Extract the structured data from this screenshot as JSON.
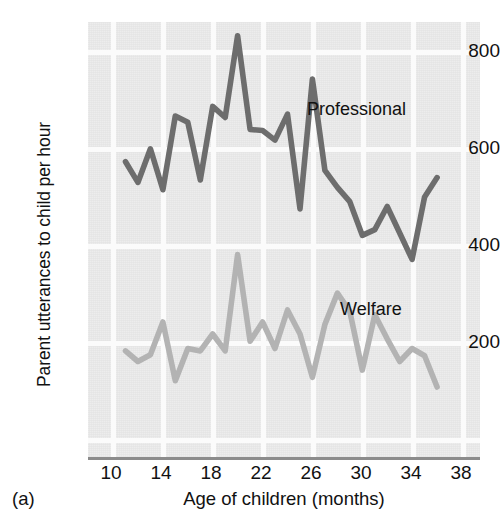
{
  "figure": {
    "panel_letter": "(a)",
    "background": "#e9e9e9",
    "gridline_color": "#fbfbfb",
    "axis_color": "#8b8b8b"
  },
  "labels": {
    "ylabel": "Parent utterances to child per hour",
    "xlabel": "Age of children (months)",
    "professional": "Professional",
    "welfare": "Welfare"
  },
  "axes": {
    "yticks": [
      "800",
      "600",
      "400",
      "200"
    ],
    "xticks": [
      "10",
      "14",
      "18",
      "22",
      "26",
      "30",
      "34",
      "38"
    ]
  },
  "chart_data": {
    "type": "line",
    "title": "",
    "xlabel": "Age of children (months)",
    "ylabel": "Parent utterances to child per hour",
    "xlim": [
      9,
      38
    ],
    "ylim": [
      0,
      870
    ],
    "yticks": [
      200,
      400,
      600,
      800
    ],
    "xticks": [
      10,
      14,
      18,
      22,
      26,
      30,
      34,
      38
    ],
    "grid": true,
    "legend": "inline-annotation",
    "series": [
      {
        "name": "Professional",
        "color": "#6d6d6d",
        "x": [
          11,
          12,
          13,
          14,
          15,
          16,
          17,
          18,
          19,
          20,
          21,
          22,
          23,
          24,
          25,
          26,
          27,
          28,
          29,
          30,
          31,
          32,
          33,
          34,
          35,
          36
        ],
        "values": [
          573,
          530,
          600,
          515,
          668,
          655,
          535,
          688,
          665,
          835,
          640,
          638,
          618,
          672,
          475,
          745,
          555,
          520,
          490,
          420,
          432,
          480,
          425,
          370,
          500,
          540
        ]
      },
      {
        "name": "Welfare",
        "color": "#b3b3b3",
        "x": [
          11,
          12,
          13,
          14,
          15,
          16,
          17,
          18,
          19,
          20,
          21,
          22,
          23,
          24,
          25,
          26,
          27,
          28,
          29,
          30,
          31,
          32,
          33,
          34,
          35,
          36
        ],
        "values": [
          180,
          158,
          172,
          240,
          118,
          185,
          180,
          215,
          180,
          380,
          200,
          240,
          185,
          265,
          215,
          125,
          235,
          300,
          262,
          140,
          255,
          205,
          158,
          185,
          170,
          105
        ]
      }
    ]
  }
}
